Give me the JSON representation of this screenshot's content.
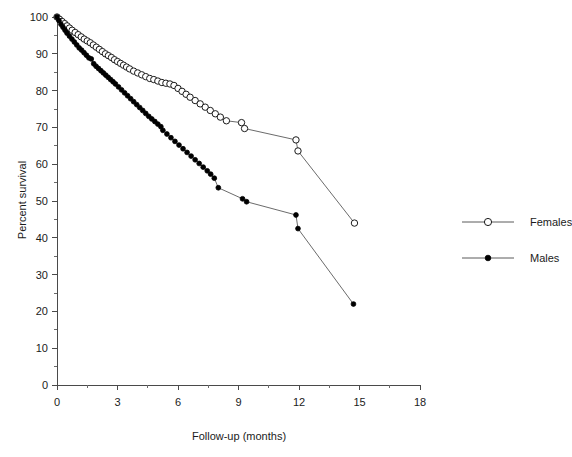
{
  "chart_data": {
    "type": "line",
    "title": "",
    "subtitle": "",
    "xlabel": "Follow-up (months)",
    "ylabel": "Percent survival",
    "xlim": [
      0,
      18
    ],
    "ylim": [
      0,
      100
    ],
    "xticks": [
      0,
      3,
      6,
      9,
      12,
      15,
      18
    ],
    "xtick_labels": [
      "0",
      "3",
      "6",
      "9",
      "12",
      "15",
      "18"
    ],
    "x_minor_step": 1.5,
    "yticks": [
      0,
      10,
      20,
      30,
      40,
      50,
      60,
      70,
      80,
      90,
      100
    ],
    "ytick_labels": [
      "0",
      "10",
      "20",
      "30",
      "40",
      "50",
      "60",
      "70",
      "80",
      "90",
      "100"
    ],
    "grid": false,
    "legend_position": "right",
    "legend_entries": [
      "Females",
      "Males"
    ],
    "series": [
      {
        "name": "Females",
        "marker": "open-circle",
        "marker_fill": "#ffffff",
        "marker_stroke": "#1b1b1b",
        "line_color": "#5a5a5a",
        "x": [
          0.0,
          0.12,
          0.25,
          0.38,
          0.5,
          0.62,
          0.75,
          0.9,
          1.05,
          1.2,
          1.35,
          1.5,
          1.65,
          1.8,
          1.95,
          2.1,
          2.25,
          2.4,
          2.55,
          2.7,
          2.85,
          3.0,
          3.15,
          3.3,
          3.45,
          3.6,
          3.8,
          4.0,
          4.2,
          4.4,
          4.6,
          4.8,
          5.0,
          5.2,
          5.4,
          5.6,
          5.8,
          6.0,
          6.2,
          6.4,
          6.6,
          6.85,
          7.1,
          7.35,
          7.6,
          7.85,
          8.1,
          8.4,
          9.15,
          9.3,
          11.85,
          11.95,
          14.75
        ],
        "y": [
          100.0,
          99.4,
          98.8,
          98.2,
          97.6,
          97.0,
          96.4,
          95.8,
          95.2,
          94.6,
          94.0,
          93.5,
          93.0,
          92.4,
          91.8,
          91.2,
          90.6,
          90.0,
          89.5,
          89.0,
          88.4,
          87.9,
          87.4,
          86.9,
          86.4,
          85.9,
          85.3,
          84.8,
          84.3,
          83.8,
          83.3,
          83.0,
          82.6,
          82.2,
          82.0,
          81.8,
          81.4,
          80.6,
          79.8,
          79.0,
          78.2,
          77.3,
          76.4,
          75.5,
          74.6,
          73.7,
          72.8,
          71.8,
          71.3,
          69.7,
          66.6,
          63.6,
          44.0
        ]
      },
      {
        "name": "Males",
        "marker": "filled-circle",
        "marker_fill": "#000000",
        "marker_stroke": "#000000",
        "line_color": "#5a5a5a",
        "x": [
          0.0,
          0.1,
          0.2,
          0.3,
          0.4,
          0.5,
          0.62,
          0.74,
          0.86,
          0.98,
          1.1,
          1.22,
          1.34,
          1.46,
          1.58,
          1.7,
          1.82,
          1.94,
          2.06,
          2.18,
          2.3,
          2.42,
          2.54,
          2.66,
          2.78,
          2.9,
          3.05,
          3.2,
          3.35,
          3.5,
          3.65,
          3.8,
          3.95,
          4.1,
          4.25,
          4.4,
          4.55,
          4.7,
          4.85,
          5.0,
          5.15,
          5.25,
          5.45,
          5.65,
          5.85,
          6.05,
          6.25,
          6.45,
          6.65,
          6.85,
          7.05,
          7.25,
          7.45,
          7.62,
          7.8,
          8.0,
          9.2,
          9.4,
          11.85,
          11.95,
          14.7
        ],
        "y": [
          100.0,
          99.0,
          98.0,
          97.2,
          96.4,
          95.6,
          94.8,
          94.0,
          93.2,
          92.4,
          91.6,
          91.0,
          90.3,
          89.6,
          88.9,
          88.6,
          87.3,
          86.6,
          86.0,
          85.4,
          84.8,
          84.2,
          83.6,
          83.0,
          82.4,
          81.8,
          81.0,
          80.2,
          79.4,
          78.6,
          77.8,
          77.0,
          76.2,
          75.4,
          74.6,
          73.8,
          73.0,
          72.3,
          71.6,
          70.9,
          70.2,
          69.2,
          68.2,
          67.2,
          66.2,
          65.2,
          64.2,
          63.2,
          62.2,
          61.2,
          60.2,
          59.2,
          58.2,
          57.3,
          56.2,
          53.6,
          50.6,
          49.8,
          46.2,
          42.5,
          22.0
        ]
      }
    ]
  }
}
